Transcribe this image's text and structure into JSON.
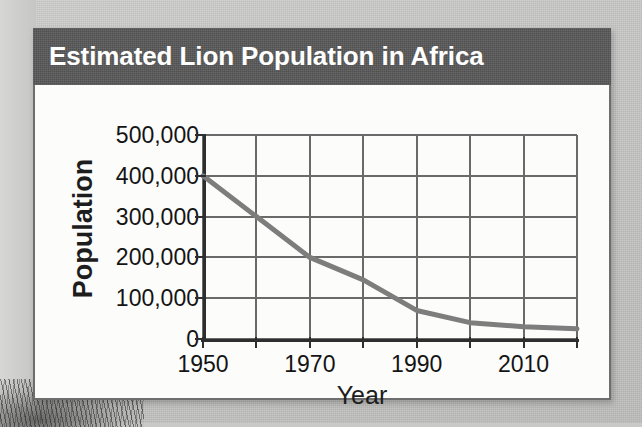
{
  "card": {
    "title": "Estimated Lion Population in Africa",
    "banner_color": "#595959",
    "title_color": "#ffffff",
    "background_color": "#fbfbfa"
  },
  "chart_data": {
    "type": "line",
    "title": "Estimated Lion Population in Africa",
    "xlabel": "Year",
    "ylabel": "Population",
    "xlim": [
      1950,
      2020
    ],
    "ylim": [
      0,
      500000
    ],
    "grid": true,
    "legend": "none",
    "line_color": "#7d7d7d",
    "grid_color": "#6a6a6a",
    "axis_color": "#2e2e2e",
    "x": [
      1950,
      1960,
      1970,
      1980,
      1990,
      2000,
      2010,
      2020
    ],
    "values": [
      400000,
      300000,
      200000,
      145000,
      70000,
      40000,
      30000,
      25000
    ],
    "series": [
      {
        "name": "Estimated lion population",
        "values": [
          400000,
          300000,
          200000,
          145000,
          70000,
          40000,
          30000,
          25000
        ]
      }
    ],
    "y_ticks": [
      0,
      100000,
      200000,
      300000,
      400000,
      500000
    ],
    "y_tick_labels": [
      "0",
      "100,000",
      "200,000",
      "300,000",
      "400,000",
      "500,000"
    ],
    "x_ticks": [
      1950,
      1960,
      1970,
      1980,
      1990,
      2000,
      2010,
      2020
    ],
    "x_tick_labels_shown": [
      "1950",
      "1970",
      "1990",
      "2010"
    ],
    "x_tick_label_positions": [
      1950,
      1970,
      1990,
      2010
    ]
  }
}
